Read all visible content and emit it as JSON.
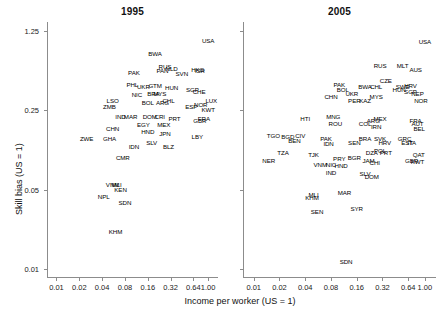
{
  "figure": {
    "background_color": "#ffffff",
    "text_color": "#1a1a1a",
    "axis_color": "#8c8c8c"
  },
  "axes": {
    "x_title": "Income per worker (US = 1)",
    "y_title": "Skill bias (US = 1)",
    "x_ticks": [
      "0.01",
      "0.02",
      "0.04",
      "0.08",
      "0.16",
      "0.32",
      "0.64",
      "1.00"
    ],
    "y_ticks": [
      "1.25",
      "0.25",
      "0.05",
      "0.01"
    ]
  },
  "chart_data": {
    "type": "scatter",
    "title": "",
    "xlabel": "Income per worker (US = 1)",
    "ylabel": "Skill bias (US = 1)",
    "xscale": "log",
    "yscale": "log",
    "xlim": [
      0.0075,
      1.35
    ],
    "ylim": [
      0.0085,
      1.5
    ],
    "x_ticks": [
      0.01,
      0.02,
      0.04,
      0.08,
      0.16,
      0.32,
      0.64,
      1.0
    ],
    "y_ticks": [
      1.25,
      0.25,
      0.05,
      0.01
    ],
    "grid": false,
    "legend": null,
    "marker": "text-label",
    "panels": [
      {
        "name": "panel-1995",
        "title": "1995",
        "points": [
          {
            "label": "USA",
            "x": 1.0,
            "y": 1.02
          },
          {
            "label": "BWA",
            "x": 0.2,
            "y": 0.78
          },
          {
            "label": "RUS",
            "x": 0.27,
            "y": 0.6
          },
          {
            "label": "PAN",
            "x": 0.25,
            "y": 0.55
          },
          {
            "label": "NLD",
            "x": 0.33,
            "y": 0.58
          },
          {
            "label": "SVN",
            "x": 0.45,
            "y": 0.52
          },
          {
            "label": "HKG",
            "x": 0.73,
            "y": 0.57
          },
          {
            "label": "ISR",
            "x": 0.78,
            "y": 0.56
          },
          {
            "label": "PAK",
            "x": 0.105,
            "y": 0.53
          },
          {
            "label": "PHL",
            "x": 0.1,
            "y": 0.42
          },
          {
            "label": "UKR",
            "x": 0.14,
            "y": 0.4
          },
          {
            "label": "GTM",
            "x": 0.2,
            "y": 0.41
          },
          {
            "label": "HUN",
            "x": 0.33,
            "y": 0.39
          },
          {
            "label": "SGP",
            "x": 0.62,
            "y": 0.38
          },
          {
            "label": "NIC",
            "x": 0.115,
            "y": 0.34
          },
          {
            "label": "BRA",
            "x": 0.19,
            "y": 0.35
          },
          {
            "label": "MYS",
            "x": 0.23,
            "y": 0.35
          },
          {
            "label": "CHE",
            "x": 0.76,
            "y": 0.36
          },
          {
            "label": "LUX",
            "x": 1.1,
            "y": 0.3
          },
          {
            "label": "LSO",
            "x": 0.055,
            "y": 0.3
          },
          {
            "label": "ZMB",
            "x": 0.05,
            "y": 0.27
          },
          {
            "label": "BOL",
            "x": 0.16,
            "y": 0.29
          },
          {
            "label": "ARG",
            "x": 0.25,
            "y": 0.29
          },
          {
            "label": "CHL",
            "x": 0.3,
            "y": 0.3
          },
          {
            "label": "ESP",
            "x": 0.6,
            "y": 0.27
          },
          {
            "label": "NOR",
            "x": 0.8,
            "y": 0.28
          },
          {
            "label": "KWT",
            "x": 1.0,
            "y": 0.25
          },
          {
            "label": "IND",
            "x": 0.07,
            "y": 0.22
          },
          {
            "label": "MAR",
            "x": 0.095,
            "y": 0.22
          },
          {
            "label": "DOM",
            "x": 0.17,
            "y": 0.22
          },
          {
            "label": "CRI",
            "x": 0.23,
            "y": 0.22
          },
          {
            "label": "PRT",
            "x": 0.36,
            "y": 0.21
          },
          {
            "label": "CHN",
            "x": 0.055,
            "y": 0.17
          },
          {
            "label": "EGY",
            "x": 0.14,
            "y": 0.185
          },
          {
            "label": "MEX",
            "x": 0.26,
            "y": 0.185
          },
          {
            "label": "GBR",
            "x": 0.78,
            "y": 0.2
          },
          {
            "label": "FRA",
            "x": 0.88,
            "y": 0.21
          },
          {
            "label": "ZWE",
            "x": 0.025,
            "y": 0.14
          },
          {
            "label": "GHA",
            "x": 0.05,
            "y": 0.14
          },
          {
            "label": "HND",
            "x": 0.16,
            "y": 0.16
          },
          {
            "label": "JPN",
            "x": 0.27,
            "y": 0.155
          },
          {
            "label": "LBY",
            "x": 0.72,
            "y": 0.145
          },
          {
            "label": "IDN",
            "x": 0.105,
            "y": 0.12
          },
          {
            "label": "SLV",
            "x": 0.18,
            "y": 0.13
          },
          {
            "label": "BLZ",
            "x": 0.3,
            "y": 0.12
          },
          {
            "label": "CMR",
            "x": 0.075,
            "y": 0.095
          },
          {
            "label": "VNM",
            "x": 0.055,
            "y": 0.055
          },
          {
            "label": "MLI",
            "x": 0.062,
            "y": 0.055
          },
          {
            "label": "KEN",
            "x": 0.07,
            "y": 0.05
          },
          {
            "label": "NPL",
            "x": 0.042,
            "y": 0.043
          },
          {
            "label": "SDN",
            "x": 0.08,
            "y": 0.038
          },
          {
            "label": "KHM",
            "x": 0.06,
            "y": 0.021
          }
        ]
      },
      {
        "name": "panel-2005",
        "title": "2005",
        "points": [
          {
            "label": "USA",
            "x": 1.0,
            "y": 1.0
          },
          {
            "label": "RUS",
            "x": 0.3,
            "y": 0.62
          },
          {
            "label": "MLT",
            "x": 0.55,
            "y": 0.62
          },
          {
            "label": "AUS",
            "x": 0.78,
            "y": 0.57
          },
          {
            "label": "PAK",
            "x": 0.1,
            "y": 0.42
          },
          {
            "label": "BOL",
            "x": 0.11,
            "y": 0.38
          },
          {
            "label": "BWA",
            "x": 0.2,
            "y": 0.4
          },
          {
            "label": "CHL",
            "x": 0.27,
            "y": 0.4
          },
          {
            "label": "CZE",
            "x": 0.35,
            "y": 0.45
          },
          {
            "label": "SWE",
            "x": 0.55,
            "y": 0.4
          },
          {
            "label": "HRV",
            "x": 0.68,
            "y": 0.41
          },
          {
            "label": "CHN",
            "x": 0.08,
            "y": 0.33
          },
          {
            "label": "UKR",
            "x": 0.14,
            "y": 0.35
          },
          {
            "label": "PER",
            "x": 0.15,
            "y": 0.3
          },
          {
            "label": "KAZ",
            "x": 0.2,
            "y": 0.3
          },
          {
            "label": "MYS",
            "x": 0.27,
            "y": 0.33
          },
          {
            "label": "HUN",
            "x": 0.5,
            "y": 0.38
          },
          {
            "label": "SGP",
            "x": 0.68,
            "y": 0.36
          },
          {
            "label": "NEP",
            "x": 0.82,
            "y": 0.35
          },
          {
            "label": "NOR",
            "x": 0.9,
            "y": 0.3
          },
          {
            "label": "HTI",
            "x": 0.04,
            "y": 0.21
          },
          {
            "label": "MNG",
            "x": 0.085,
            "y": 0.22
          },
          {
            "label": "ROU",
            "x": 0.09,
            "y": 0.19
          },
          {
            "label": "COL",
            "x": 0.2,
            "y": 0.19
          },
          {
            "label": "ARG",
            "x": 0.25,
            "y": 0.2
          },
          {
            "label": "MEX",
            "x": 0.3,
            "y": 0.21
          },
          {
            "label": "IRN",
            "x": 0.27,
            "y": 0.18
          },
          {
            "label": "FRA",
            "x": 0.78,
            "y": 0.2
          },
          {
            "label": "AUT",
            "x": 0.82,
            "y": 0.19
          },
          {
            "label": "BEL",
            "x": 0.86,
            "y": 0.17
          },
          {
            "label": "TGO",
            "x": 0.017,
            "y": 0.15
          },
          {
            "label": "BGD",
            "x": 0.025,
            "y": 0.145
          },
          {
            "label": "CIV",
            "x": 0.035,
            "y": 0.15
          },
          {
            "label": "BEN",
            "x": 0.03,
            "y": 0.135
          },
          {
            "label": "PAK",
            "x": 0.07,
            "y": 0.14
          },
          {
            "label": "IDN",
            "x": 0.075,
            "y": 0.125
          },
          {
            "label": "SEN",
            "x": 0.15,
            "y": 0.13
          },
          {
            "label": "BRA",
            "x": 0.2,
            "y": 0.14
          },
          {
            "label": "SVK",
            "x": 0.3,
            "y": 0.14
          },
          {
            "label": "HRV",
            "x": 0.34,
            "y": 0.13
          },
          {
            "label": "GRC",
            "x": 0.58,
            "y": 0.14
          },
          {
            "label": "EST",
            "x": 0.62,
            "y": 0.13
          },
          {
            "label": "ITA",
            "x": 0.7,
            "y": 0.13
          },
          {
            "label": "TZA",
            "x": 0.022,
            "y": 0.105
          },
          {
            "label": "TJK",
            "x": 0.05,
            "y": 0.1
          },
          {
            "label": "DZA",
            "x": 0.24,
            "y": 0.105
          },
          {
            "label": "POL",
            "x": 0.3,
            "y": 0.11
          },
          {
            "label": "PRT",
            "x": 0.35,
            "y": 0.105
          },
          {
            "label": "QAT",
            "x": 0.85,
            "y": 0.1
          },
          {
            "label": "NER",
            "x": 0.015,
            "y": 0.09
          },
          {
            "label": "PRY",
            "x": 0.1,
            "y": 0.093
          },
          {
            "label": "BGR",
            "x": 0.15,
            "y": 0.095
          },
          {
            "label": "JAM",
            "x": 0.22,
            "y": 0.09
          },
          {
            "label": "CHI",
            "x": 0.26,
            "y": 0.085
          },
          {
            "label": "GBR",
            "x": 0.7,
            "y": 0.09
          },
          {
            "label": "KWT",
            "x": 0.82,
            "y": 0.088
          },
          {
            "label": "VNM",
            "x": 0.06,
            "y": 0.082
          },
          {
            "label": "NIC",
            "x": 0.08,
            "y": 0.082
          },
          {
            "label": "HND",
            "x": 0.105,
            "y": 0.08
          },
          {
            "label": "IND",
            "x": 0.08,
            "y": 0.07
          },
          {
            "label": "SLV",
            "x": 0.2,
            "y": 0.068
          },
          {
            "label": "DOM",
            "x": 0.24,
            "y": 0.065
          },
          {
            "label": "MLI",
            "x": 0.05,
            "y": 0.045
          },
          {
            "label": "MAR",
            "x": 0.115,
            "y": 0.047
          },
          {
            "label": "KHM",
            "x": 0.048,
            "y": 0.042
          },
          {
            "label": "SYR",
            "x": 0.16,
            "y": 0.034
          },
          {
            "label": "SEN",
            "x": 0.055,
            "y": 0.032
          },
          {
            "label": "SDN",
            "x": 0.12,
            "y": 0.0115
          }
        ]
      }
    ]
  }
}
